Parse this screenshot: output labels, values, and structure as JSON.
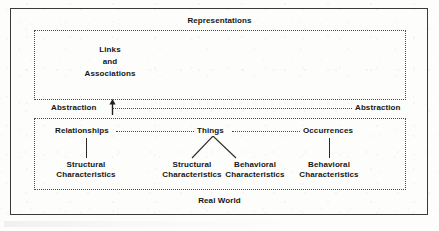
{
  "figure": {
    "top_title": "Representations",
    "bottom_title": "Real World",
    "abstraction_left_label": "Abstraction",
    "abstraction_right_label": "Abstraction",
    "representations_content": "Links\nand\nAssociations",
    "representations_lines": [
      "Links",
      "and",
      "Associations"
    ],
    "tier1": [
      {
        "id": "relationships",
        "label": "Relationships"
      },
      {
        "id": "things",
        "label": "Things"
      },
      {
        "id": "occurrences",
        "label": "Occurrences"
      }
    ],
    "tier2": [
      {
        "id": "rel-structural",
        "parent": "relationships",
        "line1": "Structural",
        "line2": "Characteristics"
      },
      {
        "id": "things-structural",
        "parent": "things",
        "line1": "Structural",
        "line2": "Characteristics"
      },
      {
        "id": "things-behavioral",
        "parent": "things",
        "line1": "Behavioral",
        "line2": "Characteristics"
      },
      {
        "id": "occ-behavioral",
        "parent": "occurrences",
        "line1": "Behavioral",
        "line2": "Characteristics"
      }
    ],
    "colors": {
      "ink": "#161616",
      "frame": "#3a3a3a",
      "dotted": "#4a4a4a",
      "paper": "#fdfdfc"
    }
  }
}
